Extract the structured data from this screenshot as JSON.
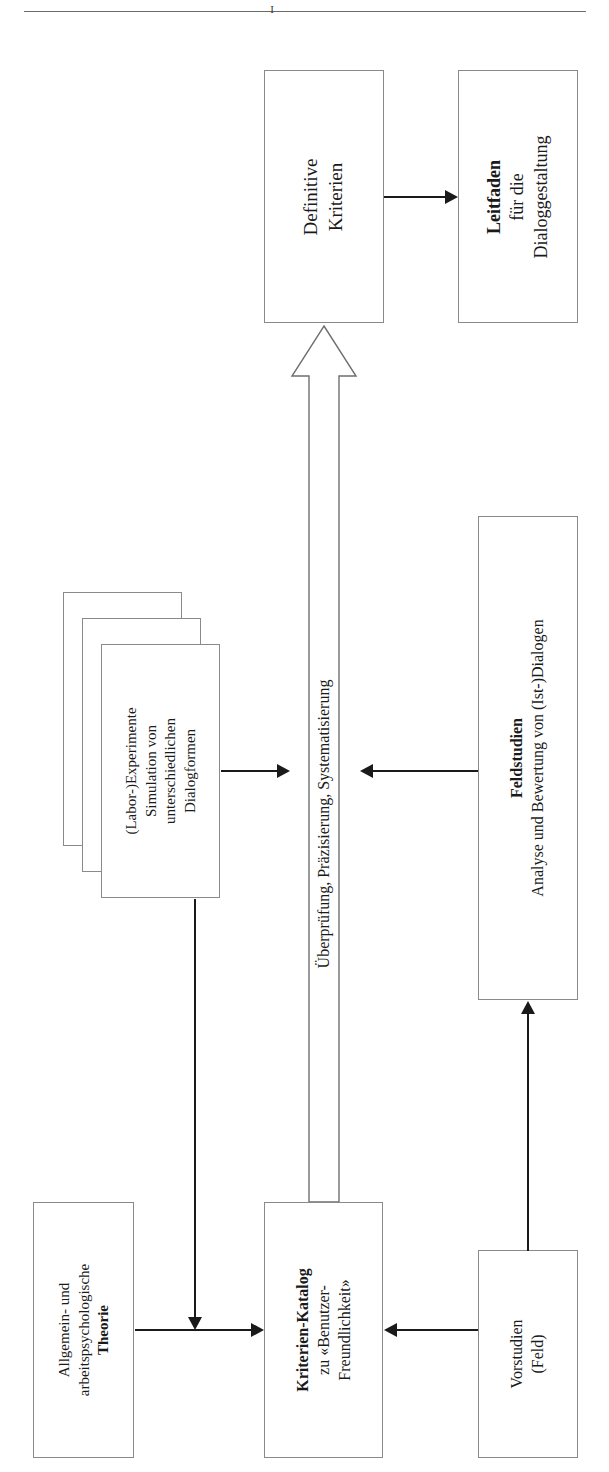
{
  "page": {
    "header_rule": true,
    "header_glyph": "I",
    "orientation": "rotated-90-ccw"
  },
  "diagram": {
    "nodes": [
      {
        "id": "definitive-kriterien",
        "lines": [
          {
            "text": "Definitive",
            "bold": false
          },
          {
            "text": "Kriterien",
            "bold": false
          }
        ]
      },
      {
        "id": "leitfaden",
        "lines": [
          {
            "text": "Leitfaden",
            "bold": true
          },
          {
            "text": "für die",
            "bold": false
          },
          {
            "text": "Dialoggestaltung",
            "bold": false
          }
        ]
      },
      {
        "id": "labor-experimente",
        "lines": [
          {
            "text": "(Labor-)Experimente",
            "bold": false
          },
          {
            "text": "Simulation von",
            "bold": false
          },
          {
            "text": "unterschiedlichen",
            "bold": false
          },
          {
            "text": "Dialogformen",
            "bold": false
          }
        ]
      },
      {
        "id": "feldstudien",
        "lines": [
          {
            "text": "Feldstudien",
            "bold": true
          },
          {
            "text": "Analyse und Bewertung von (Ist-)Dialogen",
            "bold": false
          }
        ]
      },
      {
        "id": "allgemein-theorie",
        "lines": [
          {
            "text": "Allgemein- und",
            "bold": false
          },
          {
            "text": "arbeitspsychologische",
            "bold": false
          },
          {
            "text": "Theorie",
            "bold": true
          }
        ]
      },
      {
        "id": "kriterien-katalog",
        "lines": [
          {
            "text": "Kriterien-Katalog",
            "bold": true
          },
          {
            "text": "zu «Benutzer-",
            "bold": false
          },
          {
            "text": "Freundlichkeit»",
            "bold": false
          }
        ]
      },
      {
        "id": "vorstudien",
        "lines": [
          {
            "text": "Vorstudien",
            "bold": false
          },
          {
            "text": "(Feld)",
            "bold": false
          }
        ]
      }
    ],
    "process_arrow": {
      "id": "ueberpruefung-arrow",
      "label": "Überprüfung, Präzisierung, Systematisierung",
      "direction": "up",
      "style": "hollow-outline"
    },
    "edges": [
      {
        "id": "edge-kriterien-to-leitfaden",
        "from": "definitive-kriterien",
        "to": "leitfaden",
        "direction": "right"
      },
      {
        "id": "edge-process-to-definitive",
        "from": "process-arrow",
        "to": "definitive-kriterien",
        "direction": "up"
      },
      {
        "id": "edge-labor-to-process",
        "from": "labor-experimente",
        "to": "process-arrow",
        "direction": "right"
      },
      {
        "id": "edge-feldstudien-to-process",
        "from": "feldstudien",
        "to": "process-arrow",
        "direction": "left"
      },
      {
        "id": "edge-theorie-to-katalog",
        "from": "allgemein-theorie",
        "to": "kriterien-katalog",
        "direction": "right"
      },
      {
        "id": "edge-labor-to-katalog",
        "from": "labor-experimente",
        "to": "kriterien-katalog",
        "direction": "down"
      },
      {
        "id": "edge-vorstudien-to-katalog",
        "from": "vorstudien",
        "to": "kriterien-katalog",
        "direction": "left"
      },
      {
        "id": "edge-vorstudien-to-feldstudien",
        "from": "vorstudien",
        "to": "feldstudien",
        "direction": "up"
      }
    ],
    "colors": {
      "box_border": "#8a8a8a",
      "line": "#1a1a1a",
      "text": "#1a1a1a",
      "background": "#ffffff",
      "header_rule": "#6b6b6b"
    }
  }
}
